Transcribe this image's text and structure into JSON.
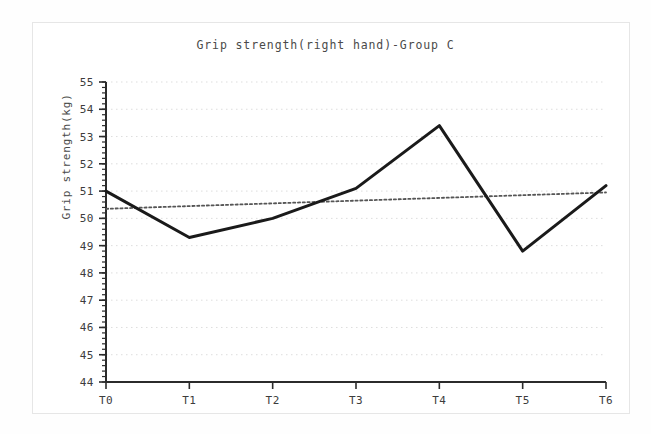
{
  "figure": {
    "title": "Grip strength(right hand)-Group C",
    "y_axis_title": "Grip strength(kg)"
  },
  "chart_data": {
    "type": "line",
    "title": "Grip strength(right hand)-Group C",
    "xlabel": "",
    "ylabel": "Grip strength(kg)",
    "categories": [
      "T0",
      "T1",
      "T2",
      "T3",
      "T4",
      "T5",
      "T6"
    ],
    "series": [
      {
        "name": "Grip strength",
        "style": "solid",
        "color": "#1a1a1a",
        "values": [
          51.0,
          49.3,
          50.0,
          51.1,
          53.4,
          48.8,
          51.2
        ]
      },
      {
        "name": "Linear trend",
        "style": "dotted",
        "color": "#555555",
        "values": [
          50.35,
          50.45,
          50.55,
          50.65,
          50.75,
          50.85,
          50.95
        ]
      }
    ],
    "ylim": [
      44,
      55
    ],
    "ytick_values": [
      55,
      54,
      53,
      52,
      51,
      50,
      49,
      48,
      47,
      46,
      45,
      44
    ],
    "ytick_labels": [
      "55",
      "54",
      "53",
      "52",
      "51",
      "50",
      "49",
      "48",
      "47",
      "46",
      "45",
      "44"
    ],
    "xtick_labels": [
      "T0",
      "T1",
      "T2",
      "T3",
      "T4",
      "T5",
      "T6"
    ],
    "grid": true,
    "grid_style": "dotted-horizontal",
    "legend": "none"
  },
  "axis": {
    "y_ticks": [
      {
        "label": "55",
        "value": 55
      },
      {
        "label": "54",
        "value": 54
      },
      {
        "label": "53",
        "value": 53
      },
      {
        "label": "52",
        "value": 52
      },
      {
        "label": "51",
        "value": 51
      },
      {
        "label": "50",
        "value": 50
      },
      {
        "label": "49",
        "value": 49
      },
      {
        "label": "48",
        "value": 48
      },
      {
        "label": "47",
        "value": 47
      },
      {
        "label": "46",
        "value": 46
      },
      {
        "label": "45",
        "value": 45
      },
      {
        "label": "44",
        "value": 44
      }
    ],
    "x_ticks": [
      {
        "label": "T0"
      },
      {
        "label": "T1"
      },
      {
        "label": "T2"
      },
      {
        "label": "T3"
      },
      {
        "label": "T4"
      },
      {
        "label": "T5"
      },
      {
        "label": "T6"
      }
    ]
  },
  "colors": {
    "series_line": "#1a1a1a",
    "trend_line": "#555555",
    "grid": "#dddddd",
    "axis": "#2b2b2b",
    "text": "#3c3c3c",
    "frame": "#e6e6e6",
    "background": "#ffffff"
  }
}
